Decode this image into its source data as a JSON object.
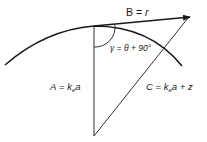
{
  "diagram": {
    "labels": {
      "b": {
        "name": "B",
        "eq": " = ",
        "val": "r"
      },
      "gamma": {
        "text": "γ = θ + 90°"
      },
      "a": {
        "name": "A",
        "eq": " = ",
        "k": "k",
        "sub": "e",
        "a": "a"
      },
      "c": {
        "name": "C",
        "eq": " = ",
        "k": "k",
        "sub": "e",
        "rest": "a + z"
      }
    },
    "colors": {
      "stroke": "#1a1a1a"
    }
  }
}
